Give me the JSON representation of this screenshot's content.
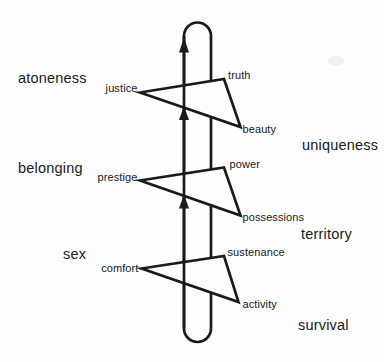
{
  "diagram": {
    "colors": {
      "ink": "#1a1a1a",
      "background": "#fdfdfd"
    },
    "levels": [
      {
        "outer_left": "atoneness",
        "outer_right": "uniqueness",
        "vane": {
          "left": "justice",
          "upper_right": "truth",
          "lower_right": "beauty"
        }
      },
      {
        "outer_left": "belonging",
        "outer_right": "territory",
        "vane": {
          "left": "prestige",
          "upper_right": "power",
          "lower_right": "possessions"
        }
      },
      {
        "outer_left": "sex",
        "outer_right": "survival",
        "vane": {
          "left": "comfort",
          "upper_right": "sustenance",
          "lower_right": "activity"
        }
      }
    ]
  }
}
